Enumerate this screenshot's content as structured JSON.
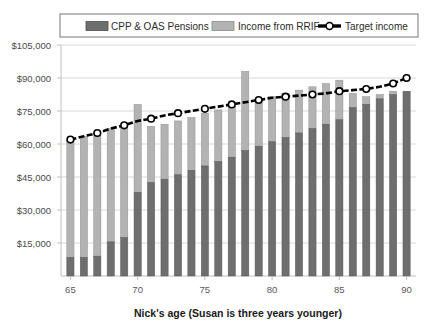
{
  "chart_data": {
    "type": "bar",
    "subtype": "stacked-bar-with-line-overlay",
    "title": "",
    "xlabel": "Nick's age (Susan is three years younger)",
    "ylabel": "",
    "xlim": [
      64.3,
      90.7
    ],
    "ylim": [
      0,
      105000
    ],
    "grid": true,
    "legend_position": "top",
    "y_ticks": [
      15000,
      30000,
      45000,
      60000,
      75000,
      90000,
      105000
    ],
    "y_tick_labels": [
      "$15,000",
      "$30,000",
      "$45,000",
      "$60,000",
      "$75,000",
      "$90,000",
      "$105,000"
    ],
    "x_ticks": [
      65,
      70,
      75,
      80,
      85,
      90
    ],
    "x_tick_labels": [
      "65",
      "70",
      "75",
      "80",
      "85",
      "90"
    ],
    "categories": [
      65,
      66,
      67,
      68,
      69,
      70,
      71,
      72,
      73,
      74,
      75,
      76,
      77,
      78,
      79,
      80,
      81,
      82,
      83,
      84,
      85,
      86,
      87,
      88,
      89,
      90
    ],
    "series": [
      {
        "name": "CPP & OAS Pensions",
        "color": "#6e6e6e",
        "values": [
          8500,
          8500,
          9000,
          15500,
          17500,
          38000,
          42500,
          44000,
          46000,
          48000,
          50000,
          52000,
          54000,
          57000,
          59000,
          61000,
          63000,
          65000,
          67000,
          69000,
          71000,
          76500,
          78000,
          80500,
          82500,
          84000
        ]
      },
      {
        "name": "Income from RRIF",
        "color": "#b3b3b3",
        "values": [
          53500,
          55000,
          56000,
          51500,
          51000,
          40000,
          25500,
          25000,
          24500,
          24000,
          24000,
          23500,
          23000,
          36000,
          21000,
          20500,
          20000,
          19500,
          19000,
          18500,
          18000,
          6500,
          3500,
          2000,
          1500,
          0
        ]
      }
    ],
    "line_series": {
      "name": "Target income",
      "color": "#000000",
      "marker": "circle-open",
      "values": [
        62000,
        63500,
        65000,
        67000,
        68500,
        70500,
        71500,
        73000,
        74000,
        75000,
        76000,
        77000,
        78000,
        79000,
        80000,
        81000,
        81500,
        82000,
        82500,
        83000,
        84000,
        84500,
        85000,
        86000,
        87500,
        90000
      ]
    }
  },
  "legend": {
    "items": [
      {
        "label": "CPP & OAS Pensions",
        "type": "swatch-dark"
      },
      {
        "label": "Income from RRIF",
        "type": "swatch-light"
      },
      {
        "label": "Target income",
        "type": "line-marker"
      }
    ]
  }
}
